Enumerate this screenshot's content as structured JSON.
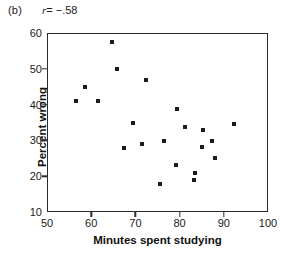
{
  "panel": {
    "label": "(b)",
    "annotation_symbol": "r",
    "annotation_value": "= −.58",
    "annotation_full": "r = −.58"
  },
  "chart_data": {
    "type": "scatter",
    "title": "",
    "subtitle": "",
    "xlabel": "Minutes spent studying",
    "ylabel": "Percent wrong",
    "xlim": [
      50,
      100
    ],
    "ylim": [
      10,
      60
    ],
    "xticks": [
      50,
      60,
      70,
      80,
      90,
      100
    ],
    "yticks": [
      10,
      20,
      30,
      40,
      50,
      60
    ],
    "xtick_labels": [
      "50",
      "60",
      "70",
      "80",
      "90",
      "100"
    ],
    "ytick_labels": [
      "10",
      "20",
      "30",
      "40",
      "50",
      "60"
    ],
    "grid": false,
    "legend": false,
    "legend_position": "none",
    "annotations": [
      {
        "text": "(b)",
        "position": "top-left-outside"
      },
      {
        "text": "r = −.58",
        "position": "top-left-outside"
      }
    ],
    "correlation_r": -0.58,
    "marker": {
      "shape": "square",
      "color": "#1c1c1c",
      "size": 4
    },
    "n_points": 22,
    "x": [
      56.3,
      58.3,
      61.3,
      64.5,
      65.5,
      67.3,
      69.3,
      71.2,
      72.2,
      75.3,
      76.2,
      79.0,
      79.2,
      81.0,
      83.0,
      83.2,
      84.8,
      85.0,
      87.0,
      87.7,
      92.0,
      78.9
    ],
    "y": [
      41.2,
      45.3,
      41.2,
      57.7,
      50.2,
      28.1,
      35.2,
      29.4,
      47.2,
      18.2,
      30.2,
      23.3,
      39.0,
      34.0,
      19.3,
      21.3,
      28.3,
      33.1,
      30.2,
      25.3,
      35.0,
      39.0
    ],
    "points": [
      {
        "x": 56.3,
        "y": 41.2
      },
      {
        "x": 58.3,
        "y": 45.3
      },
      {
        "x": 61.3,
        "y": 41.2
      },
      {
        "x": 64.5,
        "y": 57.7
      },
      {
        "x": 65.5,
        "y": 50.2
      },
      {
        "x": 67.3,
        "y": 28.1
      },
      {
        "x": 69.3,
        "y": 35.2
      },
      {
        "x": 71.2,
        "y": 29.4
      },
      {
        "x": 72.2,
        "y": 47.2
      },
      {
        "x": 75.3,
        "y": 18.2
      },
      {
        "x": 76.2,
        "y": 30.2
      },
      {
        "x": 79.0,
        "y": 23.3
      },
      {
        "x": 79.2,
        "y": 39.0
      },
      {
        "x": 81.0,
        "y": 34.0
      },
      {
        "x": 83.0,
        "y": 19.3
      },
      {
        "x": 83.2,
        "y": 21.3
      },
      {
        "x": 84.8,
        "y": 28.3
      },
      {
        "x": 85.0,
        "y": 33.1
      },
      {
        "x": 87.0,
        "y": 30.2
      },
      {
        "x": 87.7,
        "y": 25.3
      },
      {
        "x": 92.0,
        "y": 35.0
      }
    ]
  }
}
